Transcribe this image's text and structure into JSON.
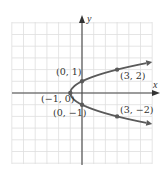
{
  "figure": {
    "type": "parabola-graph",
    "equation_form": "x = y^2 - 1",
    "axes": {
      "x_label": "x",
      "y_label": "y",
      "origin_px": [
        82,
        93
      ],
      "unit_px": 11.7,
      "x_range": [
        -6,
        6
      ],
      "y_range": [
        -6,
        6
      ]
    },
    "grid": {
      "visible": true,
      "color": "#d9d9d9"
    },
    "curve": {
      "color": "#555555",
      "opens": "right",
      "vertex": [
        -1,
        0
      ]
    },
    "points": [
      {
        "label": "(0, 1)",
        "x": 0,
        "y": 1
      },
      {
        "label": "(3, 2)",
        "x": 3,
        "y": 2
      },
      {
        "label": "(−1, 0)",
        "x": -1,
        "y": 0
      },
      {
        "label": "(0, −1)",
        "x": 0,
        "y": -1
      },
      {
        "label": "(3, −2)",
        "x": 3,
        "y": -2
      }
    ],
    "colors": {
      "axis": "#444444",
      "curve": "#5a5a5a",
      "grid": "#dedede",
      "text": "#333333"
    }
  }
}
